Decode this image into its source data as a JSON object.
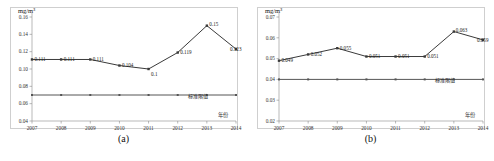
{
  "figure": {
    "panels": [
      {
        "caption": "(a)",
        "unit_label": "mg/m³",
        "x_axis_title": "年份",
        "chart_data": {
          "type": "line",
          "title": "",
          "xlabel": "年份",
          "ylabel": "mg/m³",
          "categories": [
            "2007",
            "2008",
            "2009",
            "2010",
            "2011",
            "2012",
            "2013",
            "2014"
          ],
          "x": [
            2007,
            2008,
            2009,
            2010,
            2011,
            2012,
            2013,
            2014
          ],
          "xlim": [
            2007,
            2014
          ],
          "ylim": [
            0.04,
            0.16
          ],
          "yticks": [
            "0.16",
            "0.14",
            "0.12",
            "0.10",
            "0.08",
            "0.06",
            "0.04"
          ],
          "ytick_values": [
            0.16,
            0.14,
            0.12,
            0.1,
            0.08,
            0.06,
            0.04
          ],
          "grid": false,
          "legend": "none",
          "series": [
            {
              "name": "年均值",
              "values": [
                0.111,
                0.111,
                0.111,
                0.104,
                0.1,
                0.119,
                0.15,
                0.123
              ],
              "point_labels": [
                "0.111",
                "0.111",
                "0.111",
                "0.104",
                "0.1",
                "0.119",
                "0.15",
                "0.123"
              ],
              "color": "#3a3a3a"
            },
            {
              "name": "标准限值",
              "values": [
                0.07,
                0.07,
                0.07,
                0.07,
                0.07,
                0.07,
                0.07,
                0.07
              ],
              "point_labels": [
                "",
                "",
                "",
                "",
                "",
                "",
                "",
                "标准限值"
              ],
              "color": "#555555"
            }
          ],
          "reference_line": {
            "value": 0.07,
            "label": "标准限值"
          }
        }
      },
      {
        "caption": "(b)",
        "unit_label": "mg/m³",
        "x_axis_title": "年份",
        "chart_data": {
          "type": "line",
          "title": "",
          "xlabel": "年份",
          "ylabel": "mg/m³",
          "categories": [
            "2007",
            "2008",
            "2009",
            "2010",
            "2011",
            "2012",
            "2013",
            "2014"
          ],
          "x": [
            2007,
            2008,
            2009,
            2010,
            2011,
            2012,
            2013,
            2014
          ],
          "xlim": [
            2007,
            2014
          ],
          "ylim": [
            0.02,
            0.07
          ],
          "yticks": [
            "0.07",
            "0.06",
            "0.05",
            "0.04",
            "0.03",
            "0.02"
          ],
          "ytick_values": [
            0.07,
            0.06,
            0.05,
            0.04,
            0.03,
            0.02
          ],
          "grid": false,
          "legend": "none",
          "series": [
            {
              "name": "年均值",
              "values": [
                0.049,
                0.052,
                0.055,
                0.051,
                0.051,
                0.051,
                0.063,
                0.059
              ],
              "point_labels": [
                "0.049",
                "0.052",
                "0.055",
                "0.051",
                "0.051",
                "0.051",
                "0.063",
                "0.059"
              ],
              "color": "#3a3a3a"
            },
            {
              "name": "标准限值",
              "values": [
                0.04,
                0.04,
                0.04,
                0.04,
                0.04,
                0.04,
                0.04,
                0.04
              ],
              "point_labels": [
                "",
                "",
                "",
                "",
                "",
                "",
                "",
                "标准限值"
              ],
              "color": "#555555"
            }
          ],
          "reference_line": {
            "value": 0.04,
            "label": "标准限值"
          }
        }
      }
    ]
  }
}
